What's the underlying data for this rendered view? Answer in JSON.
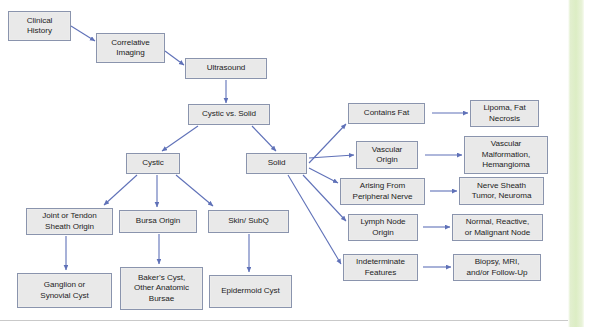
{
  "slide": {
    "title": "Soft Tissue Mass Ultrasound Evaluation Flowchart",
    "background_color": "#ffffff",
    "accent_strip_color": "#dcedc4",
    "node_fill_color": "#e9e9e9",
    "node_border_color": "#8a94ad",
    "arrow_color": "#5f71b8",
    "text_color": "#1d1d1d"
  },
  "nodes": [
    {
      "id": "clinical-history",
      "label": "Clinical\nHistory",
      "x": 8,
      "y": 11,
      "w": 63,
      "h": 30
    },
    {
      "id": "correlative-imaging",
      "label": "Correlative\nImaging",
      "x": 96,
      "y": 33,
      "w": 69,
      "h": 30
    },
    {
      "id": "ultrasound",
      "label": "Ultrasound",
      "x": 185,
      "y": 58,
      "w": 82,
      "h": 21
    },
    {
      "id": "cystic-vs-solid",
      "label": "Cystic vs. Solid",
      "x": 188,
      "y": 104,
      "w": 82,
      "h": 21
    },
    {
      "id": "cystic",
      "label": "Cystic",
      "x": 126,
      "y": 153,
      "w": 54,
      "h": 21
    },
    {
      "id": "solid",
      "label": "Solid",
      "x": 246,
      "y": 153,
      "w": 61,
      "h": 21
    },
    {
      "id": "joint-tendon-sheath",
      "label": "Joint or Tendon\nSheath Origin",
      "x": 26,
      "y": 208,
      "w": 87,
      "h": 27
    },
    {
      "id": "bursa-origin",
      "label": "Bursa Origin",
      "x": 119,
      "y": 210,
      "w": 78,
      "h": 23
    },
    {
      "id": "skin-subq",
      "label": "Skin/ SubQ",
      "x": 208,
      "y": 210,
      "w": 81,
      "h": 23
    },
    {
      "id": "ganglion-synovial-cyst",
      "label": "Ganglion or\nSynovial Cyst",
      "x": 17,
      "y": 273,
      "w": 95,
      "h": 35
    },
    {
      "id": "bakers-cyst",
      "label": "Baker’s Cyst,\nOther Anatomic\nBursae",
      "x": 120,
      "y": 267,
      "w": 83,
      "h": 43
    },
    {
      "id": "epidermoid-cyst",
      "label": "Epidermoid Cyst",
      "x": 209,
      "y": 275,
      "w": 83,
      "h": 33
    },
    {
      "id": "contains-fat",
      "label": "Contains Fat",
      "x": 348,
      "y": 103,
      "w": 77,
      "h": 21
    },
    {
      "id": "lipoma-fat-necrosis",
      "label": "Lipoma, Fat\nNecrosis",
      "x": 470,
      "y": 100,
      "w": 69,
      "h": 27
    },
    {
      "id": "vascular-origin",
      "label": "Vascular\nOrigin",
      "x": 356,
      "y": 141,
      "w": 62,
      "h": 28
    },
    {
      "id": "vascular-malformation",
      "label": "Vascular\nMalformation,\nHemangioma",
      "x": 464,
      "y": 136,
      "w": 84,
      "h": 38
    },
    {
      "id": "arising-peripheral-nerve",
      "label": "Arising From\nPeripheral Nerve",
      "x": 340,
      "y": 178,
      "w": 85,
      "h": 27
    },
    {
      "id": "nerve-sheath-tumor",
      "label": "Nerve Sheath\nTumor, Neuroma",
      "x": 459,
      "y": 177,
      "w": 85,
      "h": 28
    },
    {
      "id": "lymph-node-origin",
      "label": "Lymph Node\nOrigin",
      "x": 348,
      "y": 214,
      "w": 70,
      "h": 27
    },
    {
      "id": "normal-reactive-node",
      "label": "Normal, Reactive,\nor Malignant Node",
      "x": 452,
      "y": 214,
      "w": 91,
      "h": 27
    },
    {
      "id": "indeterminate-features",
      "label": "Indeterminate\nFeatures",
      "x": 343,
      "y": 254,
      "w": 75,
      "h": 27
    },
    {
      "id": "biopsy-mri-followup",
      "label": "Biopsy, MRI,\nand/or Follow-Up",
      "x": 453,
      "y": 254,
      "w": 88,
      "h": 27
    }
  ],
  "edges": [
    {
      "id": "clinical-history__correlative-imaging",
      "from": "clinical-history",
      "to": "correlative-imaging",
      "x1": 71,
      "y1": 26,
      "x2": 95,
      "y2": 41
    },
    {
      "id": "correlative-imaging__ultrasound",
      "from": "correlative-imaging",
      "to": "ultrasound",
      "x1": 165,
      "y1": 51,
      "x2": 184,
      "y2": 65
    },
    {
      "id": "ultrasound__cystic-vs-solid",
      "from": "ultrasound",
      "to": "cystic-vs-solid",
      "x1": 226,
      "y1": 80,
      "x2": 226,
      "y2": 103
    },
    {
      "id": "cystic-vs-solid__cystic",
      "from": "cystic-vs-solid",
      "to": "cystic",
      "x1": 198,
      "y1": 126,
      "x2": 162,
      "y2": 151
    },
    {
      "id": "cystic-vs-solid__solid",
      "from": "cystic-vs-solid",
      "to": "solid",
      "x1": 252,
      "y1": 126,
      "x2": 276,
      "y2": 151
    },
    {
      "id": "cystic__joint-tendon-sheath",
      "from": "cystic",
      "to": "joint-tendon-sheath",
      "x1": 137,
      "y1": 175,
      "x2": 104,
      "y2": 205
    },
    {
      "id": "cystic__bursa-origin",
      "from": "cystic",
      "to": "bursa-origin",
      "x1": 157,
      "y1": 175,
      "x2": 157,
      "y2": 207
    },
    {
      "id": "cystic__skin-subq",
      "from": "cystic",
      "to": "skin-subq",
      "x1": 176,
      "y1": 175,
      "x2": 213,
      "y2": 206
    },
    {
      "id": "joint-tendon-sheath__ganglion",
      "from": "joint-tendon-sheath",
      "to": "ganglion-synovial-cyst",
      "x1": 66,
      "y1": 236,
      "x2": 66,
      "y2": 270
    },
    {
      "id": "bursa-origin__bakers-cyst",
      "from": "bursa-origin",
      "to": "bakers-cyst",
      "x1": 159,
      "y1": 234,
      "x2": 159,
      "y2": 264
    },
    {
      "id": "skin-subq__epidermoid-cyst",
      "from": "skin-subq",
      "to": "epidermoid-cyst",
      "x1": 249,
      "y1": 234,
      "x2": 249,
      "y2": 272
    },
    {
      "id": "solid__contains-fat",
      "from": "solid",
      "to": "contains-fat",
      "x1": 309,
      "y1": 163,
      "x2": 346,
      "y2": 124
    },
    {
      "id": "solid__vascular-origin",
      "from": "solid",
      "to": "vascular-origin",
      "x1": 309,
      "y1": 158,
      "x2": 354,
      "y2": 155
    },
    {
      "id": "solid__arising-peripheral-nerve",
      "from": "solid",
      "to": "arising-peripheral-nerve",
      "x1": 309,
      "y1": 168,
      "x2": 338,
      "y2": 183
    },
    {
      "id": "solid__lymph-node-origin",
      "from": "solid",
      "to": "lymph-node-origin",
      "x1": 303,
      "y1": 175,
      "x2": 346,
      "y2": 221
    },
    {
      "id": "solid__indeterminate-features",
      "from": "solid",
      "to": "indeterminate-features",
      "x1": 288,
      "y1": 175,
      "x2": 341,
      "y2": 264
    },
    {
      "id": "contains-fat__lipoma",
      "from": "contains-fat",
      "to": "lipoma-fat-necrosis",
      "x1": 432,
      "y1": 113,
      "x2": 468,
      "y2": 113
    },
    {
      "id": "vascular-origin__vascular-malformation",
      "from": "vascular-origin",
      "to": "vascular-malformation",
      "x1": 425,
      "y1": 155,
      "x2": 462,
      "y2": 155
    },
    {
      "id": "arising-peripheral-nerve__nerve-sheath",
      "from": "arising-peripheral-nerve",
      "to": "nerve-sheath-tumor",
      "x1": 430,
      "y1": 191,
      "x2": 457,
      "y2": 191
    },
    {
      "id": "lymph-node-origin__normal-reactive",
      "from": "lymph-node-origin",
      "to": "normal-reactive-node",
      "x1": 423,
      "y1": 227,
      "x2": 450,
      "y2": 227
    },
    {
      "id": "indeterminate-features__biopsy",
      "from": "indeterminate-features",
      "to": "biopsy-mri-followup",
      "x1": 423,
      "y1": 267,
      "x2": 451,
      "y2": 267
    }
  ]
}
